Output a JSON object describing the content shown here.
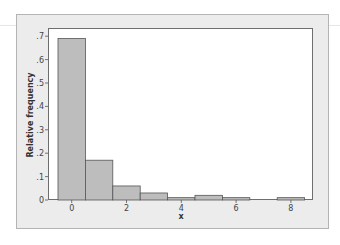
{
  "chart_data": {
    "type": "bar",
    "title": "",
    "xlabel": "x",
    "ylabel": "Relative frequency",
    "categories": [
      "0",
      "1",
      "2",
      "3",
      "4",
      "5",
      "6",
      "7",
      "8"
    ],
    "values": [
      0.69,
      0.17,
      0.06,
      0.03,
      0.01,
      0.02,
      0.01,
      0.0,
      0.01
    ],
    "x_ticks": [
      "0",
      "2",
      "4",
      "6",
      "8"
    ],
    "y_ticks": [
      "0",
      ".1",
      ".2",
      ".3",
      ".4",
      ".5",
      ".6",
      ".7"
    ],
    "ylim": [
      0,
      0.73
    ],
    "grid": false,
    "legend": null,
    "bar_color": "#bdbdbd",
    "bar_edge_color": "#555555",
    "frame_color": "#ececec"
  }
}
